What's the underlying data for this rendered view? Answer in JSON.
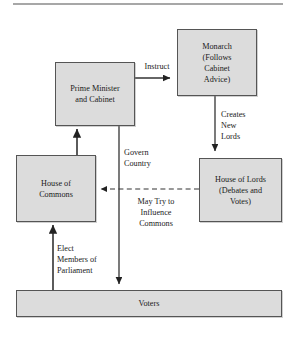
{
  "diagram": {
    "colors": {
      "box_fill": "#dcdcdc",
      "box_border": "#555555",
      "line": "#333333",
      "text": "#1a1a1a",
      "background": "#ffffff"
    },
    "nodes": [
      {
        "id": "prime-minister",
        "name": "prime-minister-and-cabinet",
        "lines": [
          "Prime Minister",
          "and Cabinet"
        ],
        "x": 55,
        "y": 62,
        "w": 80,
        "h": 64
      },
      {
        "id": "monarch",
        "name": "monarch",
        "lines": [
          "Monarch",
          "(Follows",
          "Cabinet",
          "Advice)"
        ],
        "x": 177,
        "y": 29,
        "w": 80,
        "h": 67
      },
      {
        "id": "house-of-commons",
        "name": "house-of-commons",
        "lines": [
          "House of",
          "Commons"
        ],
        "x": 16,
        "y": 155,
        "w": 80,
        "h": 67
      },
      {
        "id": "house-of-lords",
        "name": "house-of-lords",
        "lines": [
          "House of Lords",
          "(Debates and",
          "Votes)"
        ],
        "x": 199,
        "y": 158,
        "w": 83,
        "h": 64
      },
      {
        "id": "voters",
        "name": "voters",
        "lines": [
          "Voters"
        ],
        "x": 16,
        "y": 290,
        "w": 266,
        "h": 27
      }
    ],
    "edge_labels": [
      {
        "id": "instruct",
        "name": "edge-label-instruct",
        "lines": [
          "Instruct"
        ],
        "align": "center",
        "x": 136,
        "y": 61,
        "w": 42
      },
      {
        "id": "creates-new-lords",
        "name": "edge-label-creates-new-lords",
        "lines": [
          "Creates",
          "New",
          "Lords"
        ],
        "align": "left",
        "x": 221,
        "y": 109,
        "w": 44
      },
      {
        "id": "govern-country",
        "name": "edge-label-govern-country",
        "lines": [
          "Govern",
          "Country"
        ],
        "align": "left",
        "x": 124,
        "y": 147,
        "w": 48
      },
      {
        "id": "may-try-to-influence-commons",
        "name": "edge-label-may-try-to-influence-commons",
        "lines": [
          "May Try to",
          "Influence",
          "Commons"
        ],
        "align": "center",
        "x": 122,
        "y": 196,
        "w": 68
      },
      {
        "id": "elect-members-of-parliament",
        "name": "edge-label-elect-members-of-parliament",
        "lines": [
          "Elect",
          "Members of",
          "Parliament"
        ],
        "align": "left",
        "x": 57,
        "y": 243,
        "w": 58
      }
    ],
    "connectors": [
      {
        "id": "pm-to-monarch",
        "name": "connector-pm-to-monarch",
        "from": "prime-minister",
        "to": "monarch",
        "label": "Instruct",
        "style": "solid",
        "arrow": "end",
        "path": "M 135 78 L 172 78"
      },
      {
        "id": "monarch-to-lords",
        "name": "connector-monarch-to-lords",
        "from": "monarch",
        "to": "house-of-lords",
        "label": "Creates New Lords",
        "style": "solid",
        "arrow": "end",
        "path": "M 215 96 L 215 154"
      },
      {
        "id": "commons-to-pm",
        "name": "connector-commons-to-pm",
        "from": "house-of-commons",
        "to": "prime-minister",
        "label": "",
        "style": "solid",
        "arrow": "end",
        "path": "M 77 155 L 77 130"
      },
      {
        "id": "pm-to-voters",
        "name": "connector-pm-to-voters",
        "from": "prime-minister",
        "to": "voters",
        "label": "Govern Country",
        "style": "solid",
        "arrow": "end",
        "path": "M 119 126 L 119 286"
      },
      {
        "id": "lords-to-commons",
        "name": "connector-lords-to-commons",
        "from": "house-of-lords",
        "to": "house-of-commons",
        "label": "May Try to Influence Commons",
        "style": "dashed",
        "arrow": "end",
        "path": "M 199 189 L 100 189"
      },
      {
        "id": "voters-to-commons",
        "name": "connector-voters-to-commons",
        "from": "voters",
        "to": "house-of-commons",
        "label": "Elect Members of Parliament",
        "style": "solid",
        "arrow": "end",
        "path": "M 53 290 L 53 226"
      }
    ],
    "top_rule": {
      "x1": 13,
      "y1": 4,
      "x2": 283,
      "y2": 4
    }
  }
}
